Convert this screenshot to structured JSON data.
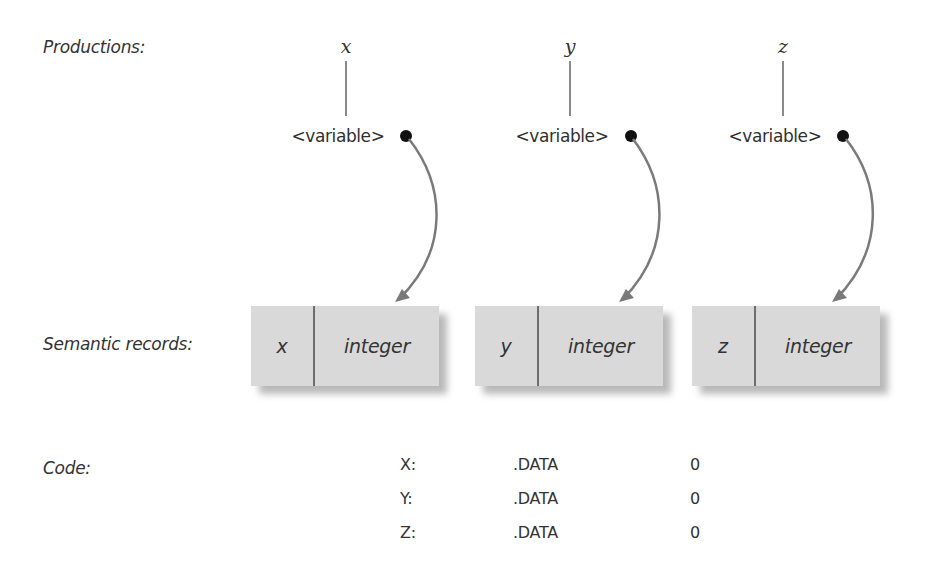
{
  "labels": {
    "productions": "Productions:",
    "semantic_records": "Semantic records:",
    "code": "Code:"
  },
  "productions": [
    {
      "terminal": "x",
      "nonterminal": "<variable>"
    },
    {
      "terminal": "y",
      "nonterminal": "<variable>"
    },
    {
      "terminal": "z",
      "nonterminal": "<variable>"
    }
  ],
  "records": [
    {
      "name": "x",
      "type": "integer"
    },
    {
      "name": "y",
      "type": "integer"
    },
    {
      "name": "z",
      "type": "integer"
    }
  ],
  "code": [
    {
      "label": "X:",
      "directive": ".DATA",
      "value": "0"
    },
    {
      "label": "Y:",
      "directive": ".DATA",
      "value": "0"
    },
    {
      "label": "Z:",
      "directive": ".DATA",
      "value": "0"
    }
  ],
  "colors": {
    "record_fill": "#d9d9d9",
    "arrow": "#7a7a7a",
    "dot": "#111111",
    "tree_line": "#8a8a8a"
  }
}
